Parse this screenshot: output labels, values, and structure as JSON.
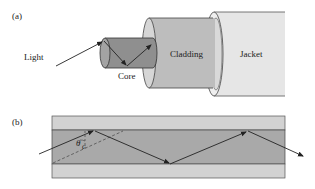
{
  "figure": {
    "panel_a": {
      "label": "(a)",
      "light_label": "Light",
      "core_label": "Core",
      "cladding_label": "Cladding",
      "jacket_label": "Jacket"
    },
    "panel_b": {
      "label": "(b)",
      "angle_symbol": "θ",
      "angle_subscript": "c"
    },
    "colors": {
      "core": "#8f8f8f",
      "cladding": "#bdbdbd",
      "cladding_face": "#d6d6d6",
      "jacket": "#e6e6e6",
      "guide_cladding": "#d2d2d2",
      "guide_core": "#a9a9a9",
      "stroke": "#333333"
    }
  }
}
